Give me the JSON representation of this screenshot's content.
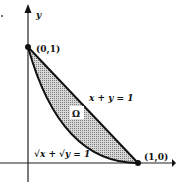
{
  "diagram": {
    "axes": {
      "x_label": "x",
      "y_label": "y"
    },
    "points": [
      {
        "name": "point-0-1",
        "label": "(0,1)"
      },
      {
        "name": "point-1-0",
        "label": "(1,0)"
      }
    ],
    "curves": {
      "line_label": "x + y = 1",
      "curve_label": "√x + √y = 1"
    },
    "region_label": "Ω",
    "colors": {
      "stroke": "#111111",
      "fill": "#b5b5b5"
    }
  }
}
